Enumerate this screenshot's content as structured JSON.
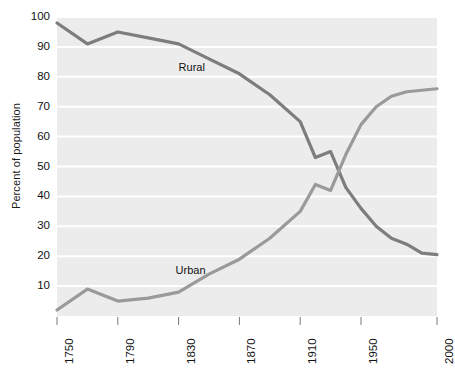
{
  "chart_data": {
    "type": "line",
    "title": "",
    "xlabel": "",
    "ylabel": "Percent of population",
    "xlim": [
      1750,
      2000
    ],
    "ylim": [
      0,
      100
    ],
    "grid": true,
    "legend_position": "inline-labels",
    "x_tick_labels": [
      "1750",
      "1790",
      "1830",
      "1870",
      "1910",
      "1950",
      "2000"
    ],
    "x_tick_values": [
      1750,
      1790,
      1830,
      1870,
      1910,
      1950,
      2000
    ],
    "y_tick_labels": [
      "10",
      "20",
      "30",
      "40",
      "50",
      "60",
      "70",
      "80",
      "90",
      "100"
    ],
    "y_tick_values": [
      10,
      20,
      30,
      40,
      50,
      60,
      70,
      80,
      90,
      100
    ],
    "x": [
      1750,
      1770,
      1790,
      1810,
      1830,
      1850,
      1870,
      1890,
      1910,
      1920,
      1930,
      1940,
      1950,
      1960,
      1970,
      1980,
      1990,
      2000
    ],
    "series": [
      {
        "name": "Rural",
        "color": "#7d7d7d",
        "values": [
          98,
          91,
          95,
          93,
          91,
          86,
          81,
          74,
          65,
          53,
          55,
          43,
          36,
          30,
          26,
          24,
          21,
          20.5
        ]
      },
      {
        "name": "Urban",
        "color": "#9a9a9a",
        "values": [
          2,
          9,
          5,
          6,
          8,
          14,
          19,
          26,
          35,
          44,
          42,
          54,
          64,
          70,
          73.5,
          75,
          75.5,
          76
        ]
      }
    ],
    "annotations": [
      {
        "text": "Rural",
        "x": 1830,
        "y": 83
      },
      {
        "text": "Urban",
        "x": 1828,
        "y": 15
      }
    ],
    "colors": {
      "plot_background": "#ececec",
      "gridline": "#ffffff",
      "rural_line": "#7d7d7d",
      "urban_line": "#9a9a9a",
      "text": "#111111",
      "page_background": "#ffffff"
    }
  }
}
